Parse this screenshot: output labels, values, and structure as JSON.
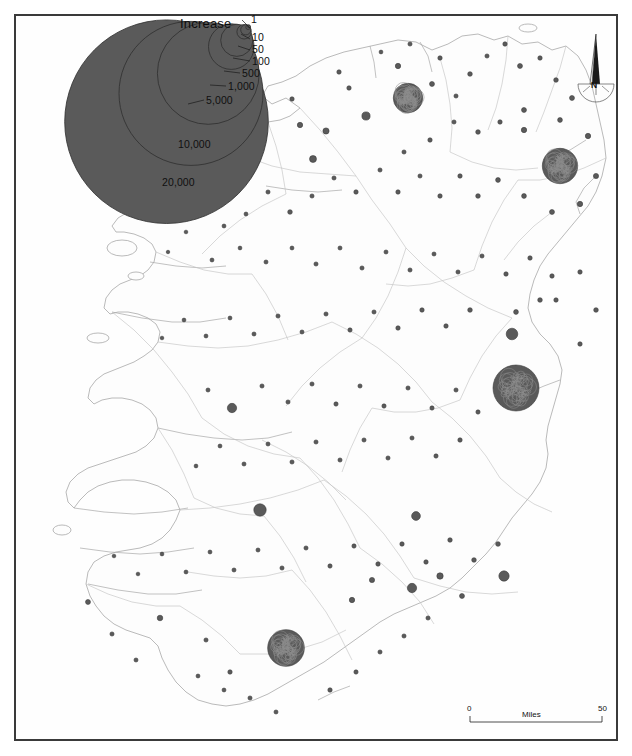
{
  "map": {
    "title": "Population Increase by District — Ireland",
    "subject": "Ireland",
    "frame_color": "#3a3a3a",
    "symbol_fill": "#5a5a5a",
    "symbol_stroke": "#3c3c3c",
    "coastline_color": "#a9a9a9",
    "boundary_color": "#bdbdbd",
    "background": "#ffffff"
  },
  "legend": {
    "title": "Increase",
    "type": "nested-proportional-circles",
    "breaks": [
      {
        "label": "1",
        "value": 1
      },
      {
        "label": "10",
        "value": 10
      },
      {
        "label": "50",
        "value": 50
      },
      {
        "label": "100",
        "value": 100
      },
      {
        "label": "500",
        "value": 500
      },
      {
        "label": "1,000",
        "value": 1000
      },
      {
        "label": "5,000",
        "value": 5000
      },
      {
        "label": "10,000",
        "value": 10000
      },
      {
        "label": "20,000",
        "value": 20000
      }
    ]
  },
  "scalebar": {
    "min_label": "0",
    "max_label": "50",
    "units_label": "Miles"
  },
  "north_arrow": {
    "label": "N"
  },
  "chart_data": {
    "type": "scatter",
    "title": "Increase",
    "xlabel": "",
    "ylabel": "",
    "legend_position": "top-left",
    "grid": false,
    "symbol_scale": "area-proportional",
    "legend_values": [
      1,
      10,
      50,
      100,
      500,
      1000,
      5000,
      10000,
      20000
    ],
    "symbols": [
      {
        "x": 408,
        "y": 98,
        "v": 9000
      },
      {
        "x": 398,
        "y": 66,
        "v": 300
      },
      {
        "x": 366,
        "y": 116,
        "v": 700
      },
      {
        "x": 349,
        "y": 88,
        "v": 200
      },
      {
        "x": 326,
        "y": 131,
        "v": 400
      },
      {
        "x": 313,
        "y": 159,
        "v": 500
      },
      {
        "x": 300,
        "y": 125,
        "v": 300
      },
      {
        "x": 292,
        "y": 99,
        "v": 200
      },
      {
        "x": 339,
        "y": 72,
        "v": 200
      },
      {
        "x": 381,
        "y": 52,
        "v": 150
      },
      {
        "x": 410,
        "y": 44,
        "v": 180
      },
      {
        "x": 440,
        "y": 58,
        "v": 200
      },
      {
        "x": 432,
        "y": 84,
        "v": 260
      },
      {
        "x": 456,
        "y": 96,
        "v": 180
      },
      {
        "x": 470,
        "y": 74,
        "v": 220
      },
      {
        "x": 487,
        "y": 56,
        "v": 180
      },
      {
        "x": 505,
        "y": 44,
        "v": 200
      },
      {
        "x": 520,
        "y": 66,
        "v": 260
      },
      {
        "x": 540,
        "y": 58,
        "v": 200
      },
      {
        "x": 556,
        "y": 80,
        "v": 220
      },
      {
        "x": 572,
        "y": 98,
        "v": 260
      },
      {
        "x": 560,
        "y": 120,
        "v": 240
      },
      {
        "x": 524,
        "y": 110,
        "v": 260
      },
      {
        "x": 500,
        "y": 122,
        "v": 200
      },
      {
        "x": 478,
        "y": 132,
        "v": 220
      },
      {
        "x": 454,
        "y": 122,
        "v": 180
      },
      {
        "x": 430,
        "y": 140,
        "v": 200
      },
      {
        "x": 404,
        "y": 152,
        "v": 180
      },
      {
        "x": 560,
        "y": 166,
        "v": 13000
      },
      {
        "x": 524,
        "y": 130,
        "v": 300
      },
      {
        "x": 588,
        "y": 136,
        "v": 300
      },
      {
        "x": 596,
        "y": 176,
        "v": 280
      },
      {
        "x": 580,
        "y": 204,
        "v": 300
      },
      {
        "x": 552,
        "y": 212,
        "v": 260
      },
      {
        "x": 524,
        "y": 196,
        "v": 240
      },
      {
        "x": 498,
        "y": 180,
        "v": 240
      },
      {
        "x": 478,
        "y": 196,
        "v": 220
      },
      {
        "x": 460,
        "y": 176,
        "v": 200
      },
      {
        "x": 440,
        "y": 196,
        "v": 200
      },
      {
        "x": 420,
        "y": 176,
        "v": 180
      },
      {
        "x": 398,
        "y": 192,
        "v": 200
      },
      {
        "x": 380,
        "y": 170,
        "v": 180
      },
      {
        "x": 356,
        "y": 192,
        "v": 200
      },
      {
        "x": 334,
        "y": 178,
        "v": 180
      },
      {
        "x": 312,
        "y": 196,
        "v": 180
      },
      {
        "x": 290,
        "y": 212,
        "v": 220
      },
      {
        "x": 268,
        "y": 192,
        "v": 180
      },
      {
        "x": 246,
        "y": 214,
        "v": 160
      },
      {
        "x": 224,
        "y": 226,
        "v": 160
      },
      {
        "x": 202,
        "y": 208,
        "v": 150
      },
      {
        "x": 186,
        "y": 232,
        "v": 140
      },
      {
        "x": 168,
        "y": 252,
        "v": 130
      },
      {
        "x": 212,
        "y": 260,
        "v": 160
      },
      {
        "x": 240,
        "y": 248,
        "v": 150
      },
      {
        "x": 266,
        "y": 262,
        "v": 170
      },
      {
        "x": 292,
        "y": 248,
        "v": 160
      },
      {
        "x": 316,
        "y": 264,
        "v": 180
      },
      {
        "x": 340,
        "y": 248,
        "v": 170
      },
      {
        "x": 362,
        "y": 268,
        "v": 180
      },
      {
        "x": 386,
        "y": 252,
        "v": 170
      },
      {
        "x": 410,
        "y": 270,
        "v": 180
      },
      {
        "x": 434,
        "y": 254,
        "v": 170
      },
      {
        "x": 458,
        "y": 272,
        "v": 180
      },
      {
        "x": 482,
        "y": 256,
        "v": 180
      },
      {
        "x": 506,
        "y": 274,
        "v": 200
      },
      {
        "x": 530,
        "y": 258,
        "v": 200
      },
      {
        "x": 552,
        "y": 276,
        "v": 200
      },
      {
        "x": 540,
        "y": 300,
        "v": 220
      },
      {
        "x": 516,
        "y": 312,
        "v": 240
      },
      {
        "x": 512,
        "y": 334,
        "v": 1400
      },
      {
        "x": 516,
        "y": 388,
        "v": 22000
      },
      {
        "x": 556,
        "y": 300,
        "v": 200
      },
      {
        "x": 580,
        "y": 272,
        "v": 200
      },
      {
        "x": 596,
        "y": 310,
        "v": 220
      },
      {
        "x": 580,
        "y": 344,
        "v": 200
      },
      {
        "x": 470,
        "y": 310,
        "v": 220
      },
      {
        "x": 446,
        "y": 326,
        "v": 200
      },
      {
        "x": 422,
        "y": 310,
        "v": 200
      },
      {
        "x": 398,
        "y": 328,
        "v": 200
      },
      {
        "x": 374,
        "y": 312,
        "v": 180
      },
      {
        "x": 350,
        "y": 330,
        "v": 190
      },
      {
        "x": 326,
        "y": 314,
        "v": 180
      },
      {
        "x": 302,
        "y": 332,
        "v": 170
      },
      {
        "x": 278,
        "y": 316,
        "v": 180
      },
      {
        "x": 254,
        "y": 334,
        "v": 170
      },
      {
        "x": 230,
        "y": 318,
        "v": 160
      },
      {
        "x": 206,
        "y": 336,
        "v": 160
      },
      {
        "x": 184,
        "y": 320,
        "v": 150
      },
      {
        "x": 162,
        "y": 338,
        "v": 140
      },
      {
        "x": 232,
        "y": 408,
        "v": 900
      },
      {
        "x": 208,
        "y": 390,
        "v": 170
      },
      {
        "x": 262,
        "y": 386,
        "v": 180
      },
      {
        "x": 288,
        "y": 402,
        "v": 180
      },
      {
        "x": 312,
        "y": 384,
        "v": 180
      },
      {
        "x": 336,
        "y": 404,
        "v": 190
      },
      {
        "x": 360,
        "y": 386,
        "v": 180
      },
      {
        "x": 384,
        "y": 406,
        "v": 190
      },
      {
        "x": 408,
        "y": 388,
        "v": 180
      },
      {
        "x": 432,
        "y": 408,
        "v": 190
      },
      {
        "x": 456,
        "y": 390,
        "v": 180
      },
      {
        "x": 478,
        "y": 412,
        "v": 190
      },
      {
        "x": 460,
        "y": 440,
        "v": 200
      },
      {
        "x": 436,
        "y": 456,
        "v": 190
      },
      {
        "x": 412,
        "y": 438,
        "v": 180
      },
      {
        "x": 388,
        "y": 458,
        "v": 180
      },
      {
        "x": 364,
        "y": 440,
        "v": 180
      },
      {
        "x": 340,
        "y": 460,
        "v": 180
      },
      {
        "x": 316,
        "y": 442,
        "v": 180
      },
      {
        "x": 292,
        "y": 462,
        "v": 180
      },
      {
        "x": 268,
        "y": 444,
        "v": 170
      },
      {
        "x": 244,
        "y": 464,
        "v": 170
      },
      {
        "x": 220,
        "y": 446,
        "v": 160
      },
      {
        "x": 196,
        "y": 466,
        "v": 150
      },
      {
        "x": 260,
        "y": 510,
        "v": 1600
      },
      {
        "x": 416,
        "y": 516,
        "v": 800
      },
      {
        "x": 504,
        "y": 576,
        "v": 1100
      },
      {
        "x": 286,
        "y": 648,
        "v": 14000
      },
      {
        "x": 498,
        "y": 544,
        "v": 230
      },
      {
        "x": 474,
        "y": 560,
        "v": 220
      },
      {
        "x": 450,
        "y": 540,
        "v": 210
      },
      {
        "x": 426,
        "y": 562,
        "v": 200
      },
      {
        "x": 402,
        "y": 544,
        "v": 200
      },
      {
        "x": 378,
        "y": 564,
        "v": 200
      },
      {
        "x": 354,
        "y": 546,
        "v": 190
      },
      {
        "x": 330,
        "y": 566,
        "v": 190
      },
      {
        "x": 306,
        "y": 548,
        "v": 180
      },
      {
        "x": 282,
        "y": 568,
        "v": 180
      },
      {
        "x": 258,
        "y": 550,
        "v": 170
      },
      {
        "x": 234,
        "y": 570,
        "v": 170
      },
      {
        "x": 210,
        "y": 552,
        "v": 160
      },
      {
        "x": 186,
        "y": 572,
        "v": 160
      },
      {
        "x": 162,
        "y": 554,
        "v": 150
      },
      {
        "x": 138,
        "y": 574,
        "v": 140
      },
      {
        "x": 114,
        "y": 556,
        "v": 140
      },
      {
        "x": 88,
        "y": 602,
        "v": 260
      },
      {
        "x": 160,
        "y": 618,
        "v": 320
      },
      {
        "x": 112,
        "y": 634,
        "v": 180
      },
      {
        "x": 136,
        "y": 660,
        "v": 170
      },
      {
        "x": 206,
        "y": 640,
        "v": 180
      },
      {
        "x": 230,
        "y": 672,
        "v": 200
      },
      {
        "x": 352,
        "y": 600,
        "v": 300
      },
      {
        "x": 372,
        "y": 580,
        "v": 280
      },
      {
        "x": 412,
        "y": 588,
        "v": 900
      },
      {
        "x": 440,
        "y": 576,
        "v": 420
      },
      {
        "x": 462,
        "y": 596,
        "v": 260
      },
      {
        "x": 330,
        "y": 690,
        "v": 200
      },
      {
        "x": 356,
        "y": 672,
        "v": 190
      },
      {
        "x": 380,
        "y": 652,
        "v": 180
      },
      {
        "x": 404,
        "y": 636,
        "v": 180
      },
      {
        "x": 428,
        "y": 618,
        "v": 180
      },
      {
        "x": 250,
        "y": 698,
        "v": 180
      },
      {
        "x": 276,
        "y": 712,
        "v": 170
      },
      {
        "x": 224,
        "y": 690,
        "v": 160
      },
      {
        "x": 198,
        "y": 676,
        "v": 160
      }
    ]
  }
}
